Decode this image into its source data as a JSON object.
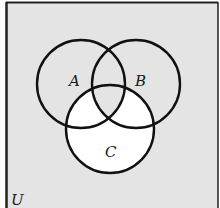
{
  "diagram": {
    "type": "venn",
    "universe_label": "U",
    "sets": [
      {
        "id": "A",
        "label": "A",
        "cx": 81,
        "cy": 84,
        "r": 44
      },
      {
        "id": "B",
        "label": "B",
        "cx": 136,
        "cy": 84,
        "r": 44
      },
      {
        "id": "C",
        "label": "C",
        "cx": 110,
        "cy": 129,
        "r": 44
      }
    ],
    "shaded_region": "(A ∪ B ∪ C)′ ∪ A ∪ B minus (C − (A ∩ B))",
    "unshaded_region": "C − (A ∩ B)",
    "colors": {
      "shaded": "#e4e4e4",
      "unshaded": "#ffffff",
      "stroke": "#111111"
    }
  }
}
